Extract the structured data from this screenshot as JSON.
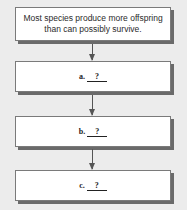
{
  "diagram": {
    "type": "flowchart",
    "start": {
      "text": "Most species produce more offspring than can possibly survive."
    },
    "steps": [
      {
        "label": "a.",
        "blank": "?"
      },
      {
        "label": "b.",
        "blank": "?"
      },
      {
        "label": "c.",
        "blank": "?"
      }
    ],
    "colors": {
      "background": "#ececec",
      "box": "#ffffff",
      "border": "#7a7a7a",
      "shadow": "#6a6a6a",
      "arrow": "#555555"
    }
  }
}
